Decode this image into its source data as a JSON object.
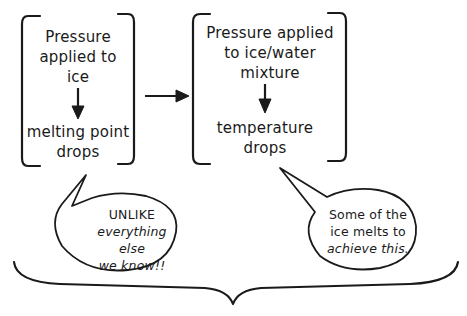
{
  "left_box": {
    "top_lines": [
      "Pressure",
      "applied to",
      "ice"
    ],
    "bottom_lines": [
      "melting point",
      "drops"
    ]
  },
  "right_box": {
    "top_lines": [
      "Pressure applied",
      "to ice/water",
      "mixture"
    ],
    "bottom_lines": [
      "temperature",
      "drops"
    ]
  },
  "left_callout": {
    "lines": [
      "UNLIKE",
      "everything else",
      "we know!!"
    ]
  },
  "right_callout": {
    "lines": [
      "Some of the",
      "ice melts to",
      "achieve this."
    ]
  },
  "colors": {
    "ink": "#1a1a1a",
    "background": "#ffffff"
  }
}
